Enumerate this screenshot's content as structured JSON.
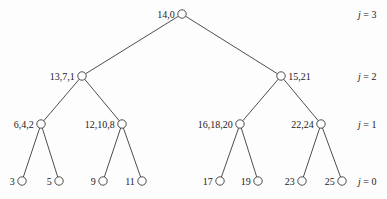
{
  "diagram": {
    "type": "tree",
    "nodes": [
      {
        "id": "n0",
        "label": "14,0",
        "level": 3,
        "parent": null
      },
      {
        "id": "n1",
        "label": "13,7,1",
        "level": 2,
        "parent": "n0"
      },
      {
        "id": "n2",
        "label": "15,21",
        "level": 2,
        "parent": "n0"
      },
      {
        "id": "n3",
        "label": "6,4,2",
        "level": 1,
        "parent": "n1"
      },
      {
        "id": "n4",
        "label": "12,10,8",
        "level": 1,
        "parent": "n1"
      },
      {
        "id": "n5",
        "label": "16,18,20",
        "level": 1,
        "parent": "n2"
      },
      {
        "id": "n6",
        "label": "22,24",
        "level": 1,
        "parent": "n2"
      },
      {
        "id": "n7",
        "label": "3",
        "level": 0,
        "parent": "n3"
      },
      {
        "id": "n8",
        "label": "5",
        "level": 0,
        "parent": "n3"
      },
      {
        "id": "n9",
        "label": "9",
        "level": 0,
        "parent": "n4"
      },
      {
        "id": "n10",
        "label": "11",
        "level": 0,
        "parent": "n4"
      },
      {
        "id": "n11",
        "label": "17",
        "level": 0,
        "parent": "n5"
      },
      {
        "id": "n12",
        "label": "19",
        "level": 0,
        "parent": "n5"
      },
      {
        "id": "n13",
        "label": "23",
        "level": 0,
        "parent": "n6"
      },
      {
        "id": "n14",
        "label": "25",
        "level": 0,
        "parent": "n6"
      }
    ],
    "level_labels": [
      {
        "var": "j",
        "value": "3"
      },
      {
        "var": "j",
        "value": "2"
      },
      {
        "var": "j",
        "value": "1"
      },
      {
        "var": "j",
        "value": "0"
      }
    ]
  }
}
